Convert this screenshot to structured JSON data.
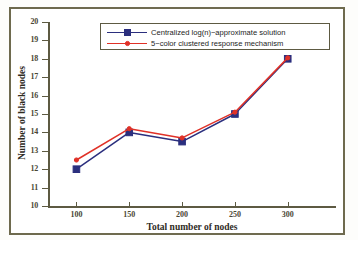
{
  "chart_data": {
    "type": "line",
    "title": "",
    "xlabel": "Total number of nodes",
    "ylabel": "Number of black nodes",
    "x": [
      100,
      150,
      200,
      250,
      300
    ],
    "xticklabels": [
      "100",
      "150",
      "200",
      "250",
      "300"
    ],
    "yticklabels": [
      "10",
      "11",
      "12",
      "13",
      "14",
      "15",
      "16",
      "17",
      "18",
      "19",
      "20"
    ],
    "xlim": [
      75,
      340
    ],
    "ylim": [
      10,
      20
    ],
    "grid": false,
    "legend_position": "top-center",
    "series": [
      {
        "name": "Centralized log(n)−approximate solution",
        "color": "#2b2f7e",
        "marker": "square",
        "values": [
          12.0,
          14.0,
          13.5,
          15.0,
          18.0
        ]
      },
      {
        "name": "5−color clustered response mechanism",
        "color": "#e03127",
        "marker": "circle",
        "values": [
          12.5,
          14.2,
          13.7,
          15.1,
          18.05
        ]
      }
    ]
  },
  "axes": {
    "y_title": "Number of black nodes",
    "x_title": "Total number of nodes",
    "y_ticks": [
      "20",
      "19",
      "18",
      "17",
      "16",
      "15",
      "14",
      "13",
      "12",
      "11",
      "10"
    ],
    "x_ticks": [
      "100",
      "150",
      "200",
      "250",
      "300"
    ]
  },
  "legend": {
    "entries": [
      {
        "label": "Centralized log(n)−approximate solution",
        "color": "#2b2f7e",
        "marker": "square"
      },
      {
        "label": "5−color clustered response mechanism",
        "color": "#e03127",
        "marker": "circle"
      }
    ]
  },
  "colors": {
    "series_blue": "#2b2f7e",
    "series_red": "#e03127",
    "frame": "#6e6a4e",
    "axis": "#5d5a42",
    "background": "#ffffff"
  }
}
